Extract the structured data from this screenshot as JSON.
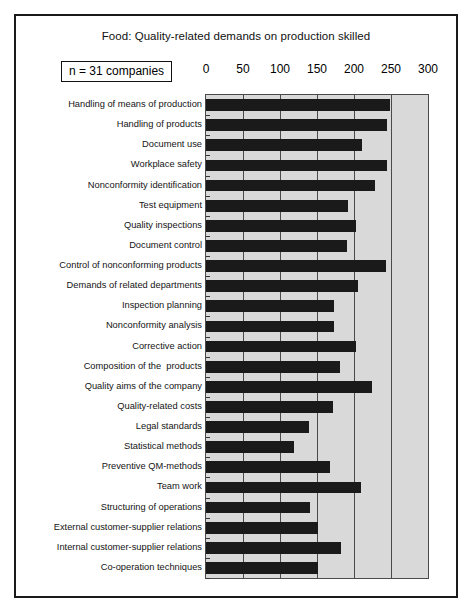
{
  "chart_data": {
    "type": "bar",
    "orientation": "horizontal",
    "title": "Food: Quality-related demands on production skilled",
    "annotation": "n = 31 companies",
    "xlabel": "",
    "ylabel": "",
    "xlim": [
      0,
      300
    ],
    "xticks": [
      0,
      50,
      100,
      150,
      200,
      250,
      300
    ],
    "xtick_labels": [
      "0",
      "50",
      "100",
      "150",
      "200",
      "250",
      "300"
    ],
    "grid": true,
    "legend": false,
    "bar_color": "#1a1a1a",
    "plot_background": "#d9d9d9",
    "categories": [
      "Handling of means of production",
      "Handling of products",
      "Document use",
      "Workplace safety",
      "Nonconformity identification",
      "Test equipment",
      "Quality inspections",
      "Document control",
      "Control of nonconforming products",
      "Demands of related departments",
      "Inspection planning",
      "Nonconformity analysis",
      "Corrective action",
      "Composition of the  products",
      "Quality aims of the company",
      "Quality-related costs",
      "Legal standards",
      "Statistical methods",
      "Preventive QM-methods",
      "Team work",
      "Structuring of operations",
      "External customer-supplier relations",
      "Internal customer-supplier relations",
      "Co-operation techniques"
    ],
    "values": [
      248,
      245,
      211,
      244,
      229,
      192,
      203,
      191,
      243,
      206,
      173,
      173,
      203,
      181,
      224,
      172,
      139,
      119,
      168,
      210,
      141,
      152,
      182,
      152
    ]
  }
}
